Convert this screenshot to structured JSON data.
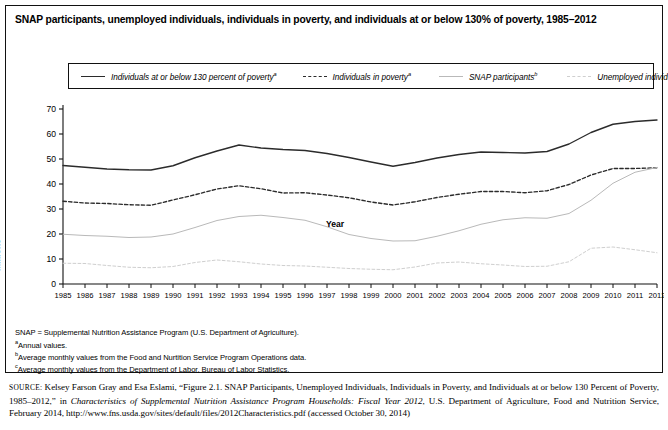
{
  "figure": {
    "title": "SNAP participants, unemployed individuals, individuals in poverty, and individuals at or below 130% of poverty, 1985–2012"
  },
  "legend": {
    "position": "top",
    "items": [
      {
        "label": "Individuals at or below 130 percent of poverty",
        "note": "a",
        "style": "solid",
        "color": "#2b2b2b"
      },
      {
        "label": "Individuals in poverty",
        "note": "a",
        "style": "dashed",
        "color": "#2b2b2b"
      },
      {
        "label": "SNAP participants",
        "note": "b",
        "style": "solid",
        "color": "#b9b9b9"
      },
      {
        "label": "Unemployed individuals",
        "note": "c",
        "style": "dashed",
        "color": "#cfcfcf"
      }
    ]
  },
  "notes": [
    {
      "text": "SNAP = Supplemental Nutrition Assistance Program (U.S. Department of Agriculture).",
      "marker": ""
    },
    {
      "text": "Annual values.",
      "marker": "a"
    },
    {
      "text": "Average monthly values from the Food and Nurtition Service Program Operations data.",
      "marker": "b"
    },
    {
      "text": "Average monthly values from the Department of Labor, Bureau of Labor Statistics.",
      "marker": "c"
    }
  ],
  "source": {
    "label": "SOURCE:",
    "part1": " Kelsey Farson Gray and Esa Eslami, “Figure 2.1. SNAP Participants, Unemployed Individuals, Individuals in Poverty, and Individuals at or below 130 Percent of Poverty, 1985–2012,” in ",
    "italic": "Characteristics of Supplemental Nutrition Assistance Program Households: Fiscal Year 2012",
    "part2": ", U.S. Department of Agriculture, Food and Nutrition Service, February 2014, http://www.fns.usda.gov/sites/default/files/2012Characteristics.pdf (accessed October 30, 2014)"
  },
  "chart_data": {
    "type": "line",
    "title": "SNAP participants, unemployed individuals, individuals in poverty, and individuals at or below 130% of poverty, 1985–2012",
    "xlabel": "Year",
    "ylabel": "Millions",
    "xlim": [
      1985,
      2012
    ],
    "ylim": [
      0,
      70
    ],
    "yticks": [
      0,
      10,
      20,
      30,
      40,
      50,
      60,
      70
    ],
    "grid": false,
    "legend_position": "top",
    "x": [
      1985,
      1986,
      1987,
      1988,
      1989,
      1990,
      1991,
      1992,
      1993,
      1994,
      1995,
      1996,
      1997,
      1998,
      1999,
      2000,
      2001,
      2002,
      2003,
      2004,
      2005,
      2006,
      2007,
      2008,
      2009,
      2010,
      2011,
      2012
    ],
    "series": [
      {
        "name": "Individuals at or below 130 percent of poverty",
        "style": "solid",
        "color": "#2b2b2b",
        "values": [
          47.4,
          46.7,
          46.0,
          45.7,
          45.6,
          47.3,
          50.5,
          53.2,
          55.6,
          54.4,
          53.8,
          53.4,
          52.2,
          50.6,
          48.8,
          47.1,
          48.6,
          50.4,
          51.8,
          52.8,
          52.6,
          52.4,
          53.0,
          56.0,
          60.6,
          63.9,
          65.0,
          65.6
        ]
      },
      {
        "name": "Individuals in poverty",
        "style": "dashed",
        "color": "#2b2b2b",
        "values": [
          33.1,
          32.4,
          32.2,
          31.7,
          31.5,
          33.6,
          35.7,
          38.0,
          39.3,
          38.1,
          36.4,
          36.5,
          35.6,
          34.5,
          32.8,
          31.6,
          32.9,
          34.6,
          35.9,
          37.0,
          37.0,
          36.5,
          37.3,
          39.8,
          43.6,
          46.2,
          46.2,
          46.5
        ]
      },
      {
        "name": "SNAP participants",
        "style": "solid",
        "color": "#b9b9b9",
        "values": [
          19.9,
          19.4,
          19.1,
          18.6,
          18.8,
          20.0,
          22.6,
          25.4,
          27.0,
          27.5,
          26.6,
          25.5,
          22.9,
          19.8,
          18.2,
          17.2,
          17.3,
          19.1,
          21.3,
          23.9,
          25.7,
          26.5,
          26.3,
          28.2,
          33.5,
          40.3,
          44.7,
          46.6
        ]
      },
      {
        "name": "Unemployed individuals",
        "style": "dashed",
        "color": "#cfcfcf",
        "values": [
          8.3,
          8.2,
          7.4,
          6.7,
          6.5,
          7.0,
          8.6,
          9.6,
          8.9,
          8.0,
          7.4,
          7.2,
          6.7,
          6.2,
          5.9,
          5.7,
          6.8,
          8.4,
          8.8,
          8.1,
          7.6,
          7.0,
          7.1,
          8.9,
          14.3,
          14.8,
          13.7,
          12.5
        ]
      }
    ]
  },
  "axes": {
    "x_ticklabels": [
      "1985",
      "1986",
      "1987",
      "1988",
      "1989",
      "1990",
      "1991",
      "1992",
      "1993",
      "1994",
      "1995",
      "1996",
      "1997",
      "1998",
      "1999",
      "2000",
      "2001",
      "2002",
      "2003",
      "2004",
      "2005",
      "2006",
      "2007",
      "2008",
      "2009",
      "2010",
      "2011",
      "2012"
    ],
    "y_ticklabels": [
      "0",
      "10",
      "20",
      "30",
      "40",
      "50",
      "60",
      "70"
    ]
  }
}
